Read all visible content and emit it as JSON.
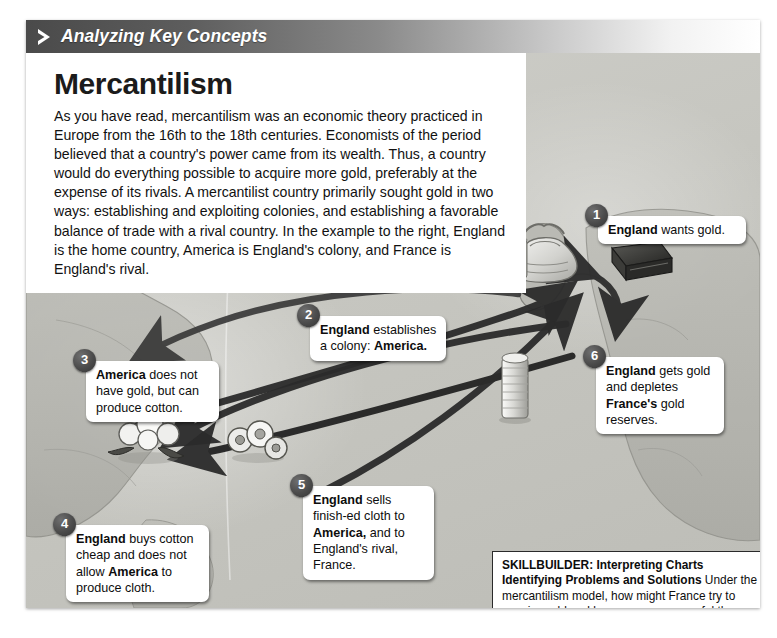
{
  "header": {
    "eyebrow": "Analyzing Key Concepts",
    "chevron_icon": "chevron-right-icon"
  },
  "document": {
    "title": "Mercantilism",
    "intro": "As you have read, mercantilism was an economic theory practiced in Europe from the 16th to the 18th centuries. Economists of the period believed that a country's power came from its wealth. Thus, a country would do everything possible to acquire more gold, preferably at the expense of its rivals. A mercantilist country primarily sought gold in two ways: establishing and exploiting colonies, and establishing a favorable balance of trade with a rival country. In the example to the right, England is the home country, America is England's colony, and France is England's rival."
  },
  "callouts": [
    {
      "number": "1",
      "name": "callout-england-wants-gold",
      "parts": [
        {
          "text": "England",
          "bold": true
        },
        {
          "text": " wants gold.",
          "bold": false
        }
      ]
    },
    {
      "number": "2",
      "name": "callout-establishes-colony",
      "parts": [
        {
          "text": "England",
          "bold": true
        },
        {
          "text": " establishes a colony: ",
          "bold": false
        },
        {
          "text": "America.",
          "bold": true
        }
      ]
    },
    {
      "number": "3",
      "name": "callout-america-no-gold",
      "parts": [
        {
          "text": "America",
          "bold": true
        },
        {
          "text": " does not have gold, but can produce cotton.",
          "bold": false
        }
      ]
    },
    {
      "number": "4",
      "name": "callout-buys-cotton-cheap",
      "parts": [
        {
          "text": "England",
          "bold": true
        },
        {
          "text": " buys cotton cheap and does not allow ",
          "bold": false
        },
        {
          "text": "America",
          "bold": true
        },
        {
          "text": " to produce cloth.",
          "bold": false
        }
      ]
    },
    {
      "number": "5",
      "name": "callout-sells-cloth",
      "parts": [
        {
          "text": "England",
          "bold": true
        },
        {
          "text": " sells finish-ed cloth to ",
          "bold": false
        },
        {
          "text": "America,",
          "bold": true
        },
        {
          "text": " and to England's rival, France.",
          "bold": false
        }
      ]
    },
    {
      "number": "6",
      "name": "callout-depletes-france-gold",
      "parts": [
        {
          "text": "England",
          "bold": true
        },
        {
          "text": " gets gold and depletes ",
          "bold": false
        },
        {
          "text": "France's",
          "bold": true
        },
        {
          "text": " gold reserves.",
          "bold": false
        }
      ]
    }
  ],
  "skillbuilder": {
    "heading": "SKILLBUILDER: Interpreting Charts",
    "subheading": "Identifying Problems and Solutions",
    "question": " Under the mercantilism model, how might France try to acquire gold and become more powerful than England?"
  },
  "illustrations": [
    {
      "name": "money-bag-icon",
      "label": "money bag of gold over Britain"
    },
    {
      "name": "gold-coin-stack-icon",
      "label": "stack of gold coins"
    },
    {
      "name": "cloth-bolt-icon",
      "label": "folded bolt of finished cloth"
    },
    {
      "name": "cotton-boll-icon",
      "label": "cotton bolls in America"
    },
    {
      "name": "cloth-rolls-icon",
      "label": "rolls of cloth in mid-Atlantic"
    }
  ],
  "colors": {
    "header_dark": "#4a4a4a",
    "map_base": "#c6c6c0",
    "landmass": "#b3b3ad",
    "arrow": "#2e2e2e",
    "callout_bg": "#ffffff",
    "badge": "#3a3a3a"
  }
}
